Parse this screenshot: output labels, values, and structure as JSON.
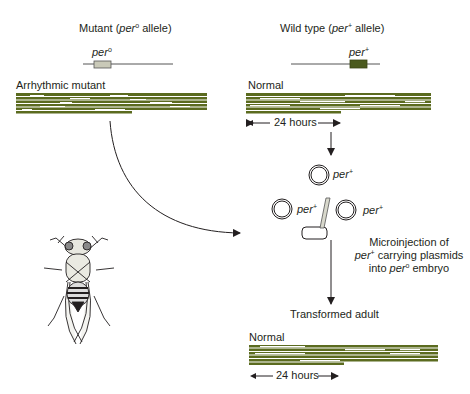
{
  "mutant": {
    "title_pre": "Mutant (",
    "title_gene": "per",
    "title_sup": "o",
    "title_post": " allele)",
    "gene_label": "per",
    "gene_sup": "o",
    "record_label": "Arrhythmic mutant",
    "gene_box_color": "#c9c9b8"
  },
  "wildtype": {
    "title_pre": "Wild type (",
    "title_gene": "per",
    "title_sup": "+",
    "title_post": " allele)",
    "gene_label": "per",
    "gene_sup": "+",
    "record_label": "Normal",
    "duration_label": "24 hours",
    "gene_box_color": "#4b5a1e"
  },
  "plasmids": [
    {
      "label": "per",
      "sup": "+"
    },
    {
      "label": "per",
      "sup": "+"
    },
    {
      "label": "per",
      "sup": "+"
    }
  ],
  "microinjection": {
    "line1": "Microinjection of",
    "line2_gene": "per",
    "line2_sup": "+",
    "line2_rest": " carrying plasmids",
    "line3_pre": "into ",
    "line3_gene": "per",
    "line3_sup": "o",
    "line3_post": " embryo"
  },
  "transformed": {
    "label": "Transformed adult",
    "record_label": "Normal",
    "duration_label": "24 hours"
  },
  "colors": {
    "activity_record": "#5b6b1f",
    "line": "#231f20"
  }
}
